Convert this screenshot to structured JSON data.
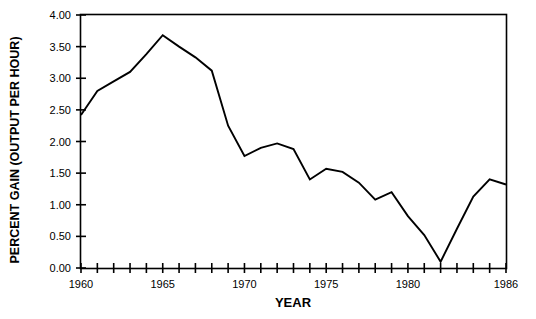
{
  "chart_data": {
    "type": "line",
    "title": "",
    "xlabel": "YEAR",
    "ylabel": "PERCENT GAIN  (OUTPUT PER HOUR)",
    "xlim": [
      1960,
      1986
    ],
    "ylim": [
      0.0,
      4.0
    ],
    "grid": false,
    "legend": null,
    "x": [
      1960,
      1961,
      1962,
      1963,
      1964,
      1965,
      1966,
      1967,
      1968,
      1969,
      1970,
      1971,
      1972,
      1973,
      1974,
      1975,
      1976,
      1977,
      1978,
      1979,
      1980,
      1981,
      1982,
      1983,
      1984,
      1985,
      1986
    ],
    "values": [
      2.42,
      2.8,
      2.95,
      3.1,
      3.38,
      3.68,
      3.5,
      3.33,
      3.12,
      2.25,
      1.77,
      1.9,
      1.97,
      1.88,
      1.4,
      1.57,
      1.52,
      1.35,
      1.08,
      1.2,
      0.82,
      0.52,
      0.1,
      0.62,
      1.13,
      1.4,
      1.32
    ],
    "series": [
      {
        "name": "Percent gain (output per hour)",
        "values": [
          2.42,
          2.8,
          2.95,
          3.1,
          3.38,
          3.68,
          3.5,
          3.33,
          3.12,
          2.25,
          1.77,
          1.9,
          1.97,
          1.88,
          1.4,
          1.57,
          1.52,
          1.35,
          1.08,
          1.2,
          0.82,
          0.52,
          0.1,
          0.62,
          1.13,
          1.4,
          1.32
        ],
        "color": "#000000"
      }
    ],
    "y_ticks": [
      0.0,
      0.5,
      1.0,
      1.5,
      2.0,
      2.5,
      3.0,
      3.5,
      4.0
    ],
    "y_tick_labels": [
      "0.00",
      "0.50",
      "1.00",
      "1.50",
      "2.00",
      "2.50",
      "3.00",
      "3.50",
      "4.00"
    ],
    "x_ticks": [
      1960,
      1961,
      1962,
      1963,
      1964,
      1965,
      1966,
      1967,
      1968,
      1969,
      1970,
      1971,
      1972,
      1973,
      1974,
      1975,
      1976,
      1977,
      1978,
      1979,
      1980,
      1981,
      1982,
      1983,
      1984,
      1985,
      1986
    ],
    "x_tick_labels": [
      {
        "value": 1960,
        "label": "1960"
      },
      {
        "value": 1965,
        "label": "1965"
      },
      {
        "value": 1970,
        "label": "1970"
      },
      {
        "value": 1975,
        "label": "1975"
      },
      {
        "value": 1980,
        "label": "1980"
      },
      {
        "value": 1986,
        "label": "1986"
      }
    ]
  }
}
